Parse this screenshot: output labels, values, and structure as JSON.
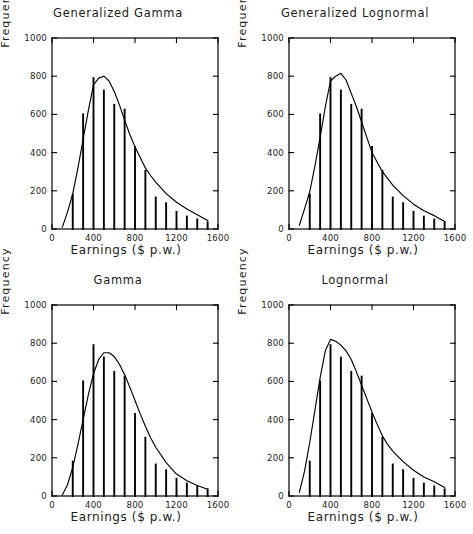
{
  "figure": {
    "title": "",
    "background": "#ffffff",
    "ink": "#000000"
  },
  "axes": {
    "xlabel": "Earnings ($ p.w.)",
    "ylabel": "Frequency",
    "xticks": [
      "0",
      "400",
      "800",
      "1200",
      "1600"
    ],
    "xtick_values": [
      0,
      400,
      800,
      1200,
      1600
    ],
    "yticks": [
      "0",
      "200",
      "400",
      "600",
      "800",
      "1000"
    ],
    "ytick_values": [
      0,
      200,
      400,
      600,
      800,
      1000
    ],
    "xlim": [
      0,
      1600
    ],
    "ylim": [
      0,
      1000
    ]
  },
  "panels": [
    {
      "id": "generalized-gamma",
      "title": "Generalized Gamma",
      "position": "top-left"
    },
    {
      "id": "generalized-lognormal",
      "title": "Generalized Lognormal",
      "position": "top-right"
    },
    {
      "id": "gamma",
      "title": "Gamma",
      "position": "bottom-left"
    },
    {
      "id": "lognormal",
      "title": "Lognormal",
      "position": "bottom-right"
    }
  ],
  "chart_data": [
    {
      "type": "bar",
      "id": "generalized-gamma",
      "title": "Generalized Gamma",
      "xlabel": "Earnings ($ p.w.)",
      "ylabel": "Frequency",
      "xlim": [
        0,
        1600
      ],
      "ylim": [
        0,
        1000
      ],
      "grid": false,
      "legend": null,
      "categories": [
        200,
        300,
        400,
        500,
        600,
        700,
        800,
        900,
        1000,
        1100,
        1200,
        1300,
        1400,
        1500
      ],
      "values": [
        180,
        600,
        790,
        725,
        650,
        625,
        430,
        305,
        165,
        135,
        90,
        65,
        50,
        35
      ],
      "series": [
        {
          "name": "Generalized Gamma fit",
          "type": "line",
          "x": [
            100,
            150,
            200,
            250,
            300,
            350,
            400,
            450,
            500,
            550,
            600,
            650,
            700,
            750,
            800,
            850,
            900,
            950,
            1000,
            1100,
            1200,
            1300,
            1400,
            1500
          ],
          "values": [
            10,
            90,
            185,
            320,
            470,
            620,
            755,
            790,
            800,
            775,
            720,
            650,
            570,
            495,
            430,
            375,
            320,
            280,
            245,
            185,
            140,
            105,
            75,
            45
          ]
        }
      ]
    },
    {
      "type": "bar",
      "id": "generalized-lognormal",
      "title": "Generalized Lognormal",
      "xlabel": "Earnings ($ p.w.)",
      "ylabel": "Frequency",
      "xlim": [
        0,
        1600
      ],
      "ylim": [
        0,
        1000
      ],
      "grid": false,
      "legend": null,
      "categories": [
        200,
        300,
        400,
        500,
        600,
        700,
        800,
        900,
        1000,
        1100,
        1200,
        1300,
        1400,
        1500
      ],
      "values": [
        180,
        600,
        790,
        725,
        650,
        625,
        430,
        305,
        165,
        135,
        90,
        65,
        50,
        35
      ],
      "series": [
        {
          "name": "Generalized Lognormal fit",
          "type": "line",
          "x": [
            100,
            150,
            200,
            250,
            300,
            350,
            400,
            450,
            500,
            550,
            600,
            650,
            700,
            750,
            800,
            850,
            900,
            950,
            1000,
            1100,
            1200,
            1300,
            1400,
            1500
          ],
          "values": [
            20,
            105,
            195,
            330,
            480,
            640,
            775,
            800,
            815,
            780,
            710,
            640,
            560,
            480,
            400,
            350,
            300,
            265,
            230,
            175,
            130,
            95,
            70,
            40
          ]
        }
      ]
    },
    {
      "type": "bar",
      "id": "gamma",
      "title": "Gamma",
      "xlabel": "Earnings ($ p.w.)",
      "ylabel": "Frequency",
      "xlim": [
        0,
        1600
      ],
      "ylim": [
        0,
        1000
      ],
      "grid": false,
      "legend": null,
      "categories": [
        200,
        300,
        400,
        500,
        600,
        700,
        800,
        900,
        1000,
        1100,
        1200,
        1300,
        1400,
        1500
      ],
      "values": [
        180,
        600,
        790,
        725,
        650,
        625,
        430,
        305,
        165,
        135,
        90,
        65,
        50,
        35
      ],
      "series": [
        {
          "name": "Gamma fit",
          "type": "line",
          "x": [
            100,
            150,
            200,
            250,
            300,
            350,
            400,
            450,
            500,
            550,
            600,
            650,
            700,
            750,
            800,
            850,
            900,
            950,
            1000,
            1100,
            1200,
            1300,
            1400,
            1500
          ],
          "values": [
            5,
            60,
            150,
            270,
            400,
            530,
            640,
            715,
            750,
            750,
            730,
            690,
            635,
            570,
            500,
            430,
            365,
            305,
            255,
            175,
            115,
            80,
            55,
            35
          ]
        }
      ]
    },
    {
      "type": "bar",
      "id": "lognormal",
      "title": "Lognormal",
      "xlabel": "Earnings ($ p.w.)",
      "ylabel": "Frequency",
      "xlim": [
        0,
        1600
      ],
      "ylim": [
        0,
        1000
      ],
      "grid": false,
      "legend": null,
      "categories": [
        200,
        300,
        400,
        500,
        600,
        700,
        800,
        900,
        1000,
        1100,
        1200,
        1300,
        1400,
        1500
      ],
      "values": [
        180,
        600,
        790,
        725,
        650,
        625,
        430,
        305,
        165,
        135,
        90,
        65,
        50,
        35
      ],
      "series": [
        {
          "name": "Lognormal fit",
          "type": "line",
          "x": [
            100,
            150,
            200,
            250,
            300,
            350,
            400,
            450,
            500,
            550,
            600,
            650,
            700,
            750,
            800,
            850,
            900,
            950,
            1000,
            1100,
            1200,
            1300,
            1400,
            1500
          ],
          "values": [
            20,
            130,
            280,
            450,
            620,
            760,
            820,
            810,
            790,
            760,
            715,
            650,
            580,
            510,
            440,
            375,
            315,
            270,
            235,
            180,
            135,
            100,
            75,
            45
          ]
        }
      ]
    }
  ]
}
